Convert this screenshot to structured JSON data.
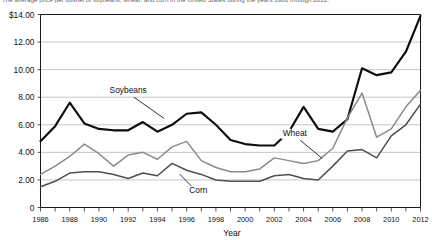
{
  "caption": {
    "text": "The average price per bushel of soybeans, wheat, and corn in the United States during the years 1986 through 2012."
  },
  "chart_data": {
    "type": "line",
    "title": "",
    "xlabel": "Year",
    "ylabel": "",
    "xlim": [
      1986,
      2012
    ],
    "ylim": [
      0,
      14
    ],
    "grid": true,
    "legend": "inline-annotations",
    "y_ticks": [
      0,
      2,
      4,
      6,
      8,
      10,
      12,
      14
    ],
    "y_tick_labels": [
      "0",
      "2.00",
      "4.00",
      "6.00",
      "8.00",
      "10.00",
      "12.00",
      "$14.00"
    ],
    "x_ticks": [
      1986,
      1988,
      1990,
      1992,
      1994,
      1996,
      1998,
      2000,
      2002,
      2004,
      2006,
      2008,
      2010,
      2012
    ],
    "x_tick_labels": [
      "1986",
      "1988",
      "1990",
      "1992",
      "1994",
      "1996",
      "1998",
      "2000",
      "2002",
      "2004",
      "2006",
      "2008",
      "2010",
      "2012"
    ],
    "x": [
      1986,
      1987,
      1988,
      1989,
      1990,
      1991,
      1992,
      1993,
      1994,
      1995,
      1996,
      1997,
      1998,
      1999,
      2000,
      2001,
      2002,
      2003,
      2004,
      2005,
      2006,
      2007,
      2008,
      2009,
      2010,
      2011,
      2012
    ],
    "series": [
      {
        "name": "Soybeans",
        "color": "#0d0d0d",
        "values": [
          4.8,
          5.9,
          7.6,
          6.1,
          5.7,
          5.6,
          5.6,
          6.2,
          5.5,
          6.0,
          6.8,
          6.9,
          6.0,
          4.9,
          4.6,
          4.5,
          4.5,
          5.5,
          7.3,
          5.7,
          5.5,
          6.4,
          10.1,
          9.6,
          9.8,
          11.3,
          13.9
        ]
      },
      {
        "name": "Wheat",
        "color": "#8a8a8a",
        "values": [
          2.4,
          3.0,
          3.7,
          4.6,
          3.9,
          3.0,
          3.8,
          4.0,
          3.5,
          4.4,
          4.8,
          3.4,
          2.9,
          2.6,
          2.6,
          2.8,
          3.6,
          3.4,
          3.2,
          3.4,
          4.3,
          6.5,
          8.3,
          5.1,
          5.7,
          7.3,
          8.5
        ]
      },
      {
        "name": "Corn",
        "color": "#4f4f4f",
        "values": [
          1.5,
          1.9,
          2.5,
          2.6,
          2.6,
          2.4,
          2.1,
          2.5,
          2.3,
          3.2,
          2.7,
          2.4,
          2.0,
          1.9,
          1.9,
          1.9,
          2.3,
          2.4,
          2.1,
          2.0,
          3.0,
          4.1,
          4.2,
          3.6,
          5.2,
          6.0,
          7.5
        ]
      }
    ],
    "annotations": [
      {
        "label": "Soybeans",
        "x": 1992.0,
        "y": 8.3
      },
      {
        "label": "Wheat",
        "x": 2003.4,
        "y": 5.2
      },
      {
        "label": "Corn",
        "x": 1996.8,
        "y": 1.05
      }
    ]
  }
}
